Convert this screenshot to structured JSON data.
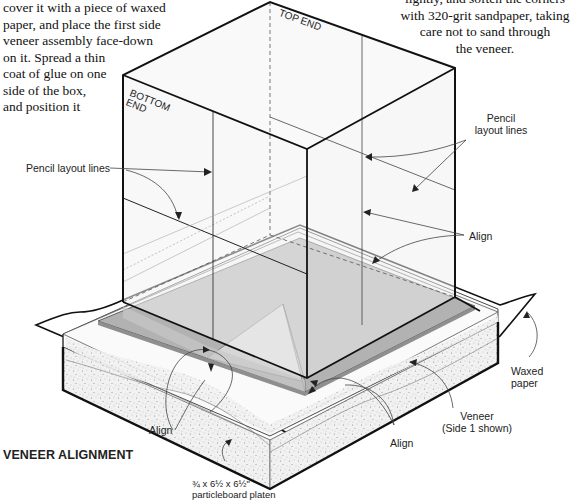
{
  "instructions": {
    "left_paragraph_lines": [
      "cover it with a piece of waxed",
      "paper, and place the first side",
      "veneer assembly face-down",
      "on it. Spread a thin",
      "coat of glue on one",
      "side of the box,",
      "and position it"
    ],
    "right_paragraph_lines": [
      "lightly, and soften the corners",
      "with 320-grit sandpaper, taking",
      "care not to sand through",
      "the veneer."
    ]
  },
  "figure": {
    "title": "VENEER ALIGNMENT",
    "box_labels": {
      "top_end": "TOP END",
      "bottom_end_line1": "BOTTOM",
      "bottom_end_line2": "END"
    },
    "callouts": {
      "pencil_layout_lines_left": "Pencil layout lines",
      "pencil_layout_lines_right_line1": "Pencil",
      "pencil_layout_lines_right_line2": "layout lines",
      "align_right": "Align",
      "align_bottom_left": "Align",
      "align_bottom_center": "Align",
      "waxed_paper": "Waxed paper",
      "veneer_line1": "Veneer",
      "veneer_line2": "(Side 1 shown)",
      "platen_line1": "¾ x 6½ x 6½\"",
      "platen_line2": "particleboard platen"
    },
    "colors": {
      "outline": "#111111",
      "box_face": "#f2f2f2",
      "veneer": "#a9a9a9",
      "veneer_light": "#d4d4d4",
      "platen_top": "#fafafa",
      "platen_side": "#ececec"
    }
  }
}
